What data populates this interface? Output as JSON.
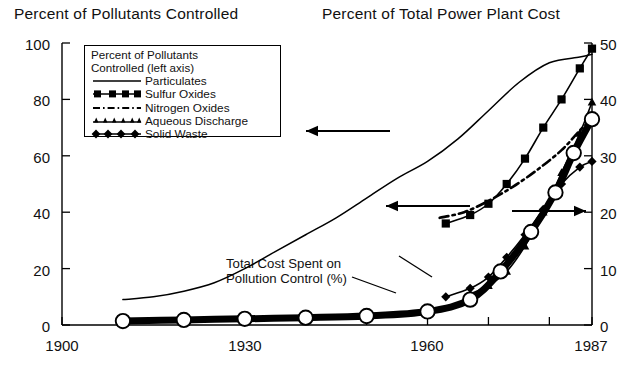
{
  "titles": {
    "left": "Percent of Pollutants Controlled",
    "right": "Percent of Total Power Plant Cost"
  },
  "legend": {
    "heading_line1": "Percent of Pollutants",
    "heading_line2": "Controlled (left axis)",
    "items": [
      {
        "label": "Particulates",
        "style": "solid-thin"
      },
      {
        "label": "Sulfur Oxides",
        "style": "solid-square"
      },
      {
        "label": "Nitrogen Oxides",
        "style": "dash-dot"
      },
      {
        "label": "Aqueous Discharge",
        "style": "solid-triangle"
      },
      {
        "label": "Solid Waste",
        "style": "solid-diamond"
      }
    ]
  },
  "annotations": [
    {
      "name": "total-cost-label",
      "line1": "Total Cost Spent on",
      "line2": "Pollution Control (%)"
    }
  ],
  "axes": {
    "left_ticks": [
      "0",
      "20",
      "40",
      "60",
      "80",
      "100"
    ],
    "right_ticks": [
      "0",
      "10",
      "20",
      "30",
      "40",
      "50"
    ],
    "x_ticks": [
      "1900",
      "1930",
      "1960",
      "1987"
    ]
  },
  "chart_data": {
    "type": "line",
    "xlabel": "",
    "ylabel": "Percent of Pollutants Controlled",
    "ylabel_right": "Percent of Total Power Plant Cost",
    "xlim": [
      1900,
      1987
    ],
    "ylim": [
      0,
      100
    ],
    "ylim_right": [
      0,
      50
    ],
    "grid": false,
    "legend_position": "upper-left",
    "x_ticks": [
      1900,
      1910,
      1920,
      1930,
      1940,
      1950,
      1960,
      1970,
      1980,
      1987
    ],
    "x_tick_labels": [
      "1900",
      "",
      "",
      "1930",
      "",
      "",
      "1960",
      "",
      "",
      "1987"
    ],
    "y_ticks_left": [
      0,
      20,
      40,
      60,
      80,
      100
    ],
    "y_ticks_right": [
      0,
      10,
      20,
      30,
      40,
      50
    ],
    "series": [
      {
        "name": "Particulates",
        "axis": "left",
        "marker": "none",
        "linestyle": "solid-thin",
        "x": [
          1910,
          1915,
          1920,
          1925,
          1930,
          1935,
          1940,
          1945,
          1950,
          1955,
          1960,
          1965,
          1970,
          1975,
          1980,
          1985,
          1987
        ],
        "values": [
          9,
          10,
          12,
          15,
          20,
          26,
          32,
          38,
          45,
          52,
          58,
          66,
          76,
          86,
          93,
          95,
          96
        ]
      },
      {
        "name": "Sulfur Oxides",
        "axis": "right",
        "marker": "square",
        "linestyle": "solid",
        "x": [
          1963,
          1967,
          1970,
          1973,
          1976,
          1979,
          1982,
          1985,
          1987
        ],
        "values": [
          18,
          19.5,
          21.5,
          25,
          29.5,
          35,
          40,
          45.5,
          49
        ]
      },
      {
        "name": "Nitrogen Oxides",
        "axis": "right",
        "marker": "none",
        "linestyle": "dash-dot",
        "x": [
          1962,
          1966,
          1970,
          1974,
          1978,
          1982,
          1985,
          1987
        ],
        "values": [
          19,
          20,
          22,
          24.5,
          27.5,
          31,
          34.5,
          36.5
        ]
      },
      {
        "name": "Aqueous Discharge",
        "axis": "right",
        "marker": "triangle",
        "linestyle": "solid",
        "x": [
          1967,
          1970,
          1973,
          1976,
          1979,
          1982,
          1985,
          1987
        ],
        "values": [
          5.5,
          7,
          9.5,
          14,
          20,
          27,
          34,
          39.5
        ]
      },
      {
        "name": "Solid Waste",
        "axis": "right",
        "marker": "diamond",
        "linestyle": "solid",
        "x": [
          1963,
          1967,
          1970,
          1973,
          1976,
          1979,
          1982,
          1985,
          1987
        ],
        "values": [
          5,
          6.5,
          8.5,
          12,
          16,
          20.5,
          25,
          28,
          29
        ]
      },
      {
        "name": "Total Cost Spent on Pollution Control (%)",
        "axis": "right",
        "marker": "open-circle",
        "linestyle": "solid-thick",
        "x": [
          1910,
          1920,
          1930,
          1940,
          1950,
          1960,
          1967,
          1972,
          1977,
          1981,
          1984,
          1987
        ],
        "values": [
          0.7,
          0.9,
          1.1,
          1.3,
          1.6,
          2.4,
          4.5,
          9.5,
          16.5,
          23.5,
          30.5,
          36.5
        ]
      }
    ]
  }
}
